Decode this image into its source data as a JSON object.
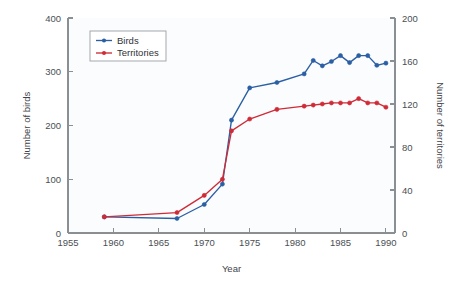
{
  "chart_data": {
    "type": "line",
    "title": "",
    "xlabel": "Year",
    "ylabel": "Number of birds",
    "y2label": "Number of territories",
    "xlim": [
      1955,
      1991
    ],
    "ylim": [
      0,
      400
    ],
    "y2lim": [
      0,
      200
    ],
    "xticks": [
      1955,
      1960,
      1965,
      1970,
      1975,
      1980,
      1985,
      1990
    ],
    "xticklabels": [
      "1955",
      "1960",
      "1965",
      "1970",
      "1975",
      "1980",
      "1985",
      "1990"
    ],
    "yticks": [
      0,
      100,
      200,
      300,
      400
    ],
    "yticklabels": [
      "0",
      "100",
      "200",
      "300",
      "400"
    ],
    "y2ticks": [
      0,
      40,
      80,
      120,
      160,
      200
    ],
    "y2ticklabels": [
      "0",
      "40",
      "80",
      "120",
      "160",
      "200"
    ],
    "grid": false,
    "legend_position": "upper left",
    "series": [
      {
        "name": "Birds",
        "color": "#2b5fa4",
        "axis": "left",
        "marker": "circle",
        "x": [
          1959,
          1967,
          1970,
          1972,
          1973,
          1975,
          1978,
          1981,
          1982,
          1983,
          1984,
          1985,
          1986,
          1987,
          1988,
          1989,
          1990
        ],
        "values": [
          30,
          27,
          53,
          91,
          210,
          270,
          280,
          296,
          321,
          311,
          319,
          330,
          317,
          330,
          330,
          312,
          316
        ]
      },
      {
        "name": "Territories",
        "color": "#cf2b37",
        "axis": "right",
        "marker": "circle",
        "x": [
          1959,
          1967,
          1970,
          1972,
          1973,
          1975,
          1978,
          1981,
          1982,
          1983,
          1984,
          1985,
          1986,
          1987,
          1988,
          1989,
          1990
        ],
        "values": [
          15,
          19,
          35,
          50,
          95,
          106,
          115,
          118,
          119,
          120,
          121,
          121,
          121,
          125,
          121,
          121,
          117
        ]
      }
    ]
  },
  "legend": {
    "entries": [
      {
        "label": "Birds",
        "color": "#2b5fa4"
      },
      {
        "label": "Territories",
        "color": "#cf2b37"
      }
    ]
  },
  "axes": {
    "x_title": "Year",
    "y_left_title": "Number of birds",
    "y_right_title": "Number of territories"
  }
}
